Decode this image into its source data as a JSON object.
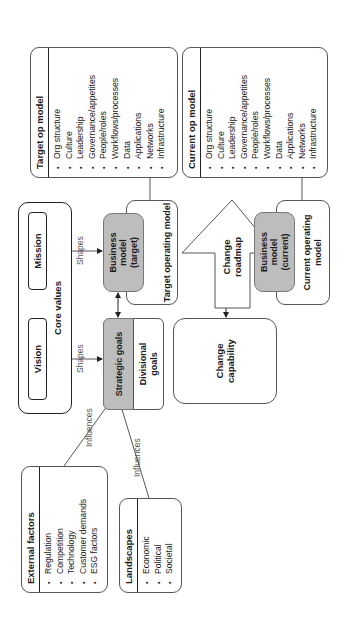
{
  "target_op_model": {
    "title": "Target op model",
    "items": [
      "Org structure",
      "Culture",
      "Leadership",
      "Governance/appetites",
      "People/roles",
      "Workflows/processes",
      "Data",
      "Applications",
      "Networks",
      "Infrastructure"
    ]
  },
  "current_op_model": {
    "title": "Current op model",
    "items": [
      "Org structure",
      "Culture",
      "Leadership",
      "Governance/appetites",
      "People/roles",
      "Workflows/processes",
      "Data",
      "Applications",
      "Networks",
      "Infrastructure"
    ]
  },
  "core_values": {
    "label": "Core values",
    "mission": "Mission",
    "vision": "Vision"
  },
  "connectors": {
    "shapes_1": "Shapes",
    "shapes_2": "Shapes",
    "influences_1": "Influences",
    "influences_2": "Influences"
  },
  "business_model_target": {
    "label": "Business model (target)"
  },
  "target_operating_model": {
    "label": "Target operating model"
  },
  "strategic_goals": {
    "label": "Strategic goals"
  },
  "divisional_goals": {
    "label": "Divisional goals"
  },
  "change_roadmap": {
    "label": "Change roadmap"
  },
  "change_capability": {
    "label": "Change capability"
  },
  "business_model_current": {
    "label": "Business model (current)"
  },
  "current_operating_model": {
    "label": "Current operating model"
  },
  "external_factors": {
    "title": "External factors",
    "items": [
      "Regulation",
      "Competition",
      "Technology",
      "Customer demands",
      "ESG factors"
    ]
  },
  "landscapes": {
    "title": "Landscapes",
    "items": [
      "Economic",
      "Political",
      "Societal"
    ]
  },
  "colors": {
    "gray_fill": "#bdbdbd",
    "line": "#555555",
    "border_dark": "#222222"
  }
}
